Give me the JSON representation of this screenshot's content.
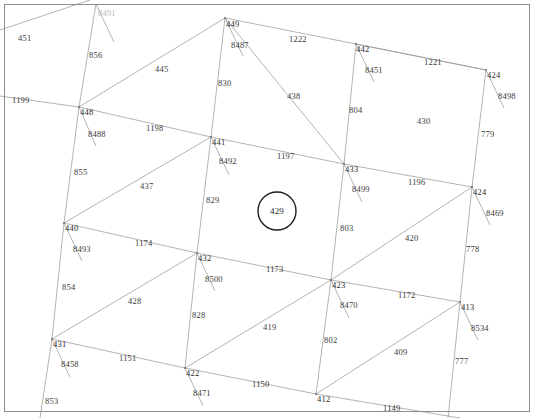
{
  "view": {
    "width": 534,
    "height": 419,
    "background": "#ffffff",
    "border_color": "#8d8d8d",
    "line_color": "#9a9a9a",
    "line_color_strong": "#6f6f6f",
    "label_color": "#3a3a3a",
    "highlight_color": "#1f1f1f"
  },
  "highlight": {
    "shape": "circle",
    "label": "429",
    "cx": 277,
    "cy": 211,
    "r": 19
  },
  "labels": [
    {
      "text": "8491",
      "x": 98,
      "y": 9,
      "kind": "faint"
    },
    {
      "text": "451",
      "x": 18,
      "y": 34,
      "kind": "plain"
    },
    {
      "text": "856",
      "x": 89,
      "y": 51,
      "kind": "plain"
    },
    {
      "text": "449",
      "x": 226,
      "y": 20,
      "kind": "node"
    },
    {
      "text": "8487",
      "x": 231,
      "y": 41,
      "kind": "plain"
    },
    {
      "text": "1222",
      "x": 289,
      "y": 35,
      "kind": "plain"
    },
    {
      "text": "442",
      "x": 356,
      "y": 45,
      "kind": "node"
    },
    {
      "text": "8451",
      "x": 365,
      "y": 66,
      "kind": "plain"
    },
    {
      "text": "1221",
      "x": 424,
      "y": 58,
      "kind": "plain"
    },
    {
      "text": "424",
      "x": 487,
      "y": 71,
      "kind": "node"
    },
    {
      "text": "8498",
      "x": 498,
      "y": 92,
      "kind": "plain"
    },
    {
      "text": "445",
      "x": 155,
      "y": 65,
      "kind": "plain"
    },
    {
      "text": "830",
      "x": 218,
      "y": 79,
      "kind": "plain"
    },
    {
      "text": "438",
      "x": 287,
      "y": 92,
      "kind": "plain"
    },
    {
      "text": "804",
      "x": 349,
      "y": 106,
      "kind": "plain"
    },
    {
      "text": "430",
      "x": 417,
      "y": 117,
      "kind": "plain"
    },
    {
      "text": "1199",
      "x": 12,
      "y": 96,
      "kind": "plain"
    },
    {
      "text": "448",
      "x": 80,
      "y": 108,
      "kind": "node"
    },
    {
      "text": "8488",
      "x": 88,
      "y": 130,
      "kind": "plain"
    },
    {
      "text": "1198",
      "x": 146,
      "y": 124,
      "kind": "plain"
    },
    {
      "text": "441",
      "x": 212,
      "y": 138,
      "kind": "node"
    },
    {
      "text": "8492",
      "x": 219,
      "y": 157,
      "kind": "plain"
    },
    {
      "text": "1197",
      "x": 277,
      "y": 152,
      "kind": "plain"
    },
    {
      "text": "433",
      "x": 345,
      "y": 165,
      "kind": "node"
    },
    {
      "text": "8499",
      "x": 352,
      "y": 185,
      "kind": "plain"
    },
    {
      "text": "779",
      "x": 481,
      "y": 130,
      "kind": "plain"
    },
    {
      "text": "855",
      "x": 74,
      "y": 168,
      "kind": "plain"
    },
    {
      "text": "437",
      "x": 140,
      "y": 182,
      "kind": "plain"
    },
    {
      "text": "829",
      "x": 206,
      "y": 196,
      "kind": "plain"
    },
    {
      "text": "1196",
      "x": 408,
      "y": 178,
      "kind": "plain"
    },
    {
      "text": "424",
      "x": 473,
      "y": 188,
      "kind": "node"
    },
    {
      "text": "8469",
      "x": 486,
      "y": 209,
      "kind": "plain"
    },
    {
      "text": "440",
      "x": 65,
      "y": 224,
      "kind": "node"
    },
    {
      "text": "8493",
      "x": 73,
      "y": 245,
      "kind": "plain"
    },
    {
      "text": "1174",
      "x": 135,
      "y": 239,
      "kind": "plain"
    },
    {
      "text": "432",
      "x": 198,
      "y": 254,
      "kind": "node"
    },
    {
      "text": "8500",
      "x": 205,
      "y": 275,
      "kind": "plain"
    },
    {
      "text": "803",
      "x": 340,
      "y": 224,
      "kind": "plain"
    },
    {
      "text": "420",
      "x": 405,
      "y": 234,
      "kind": "plain"
    },
    {
      "text": "778",
      "x": 466,
      "y": 245,
      "kind": "plain"
    },
    {
      "text": "1173",
      "x": 266,
      "y": 265,
      "kind": "plain"
    },
    {
      "text": "423",
      "x": 332,
      "y": 281,
      "kind": "node"
    },
    {
      "text": "8470",
      "x": 340,
      "y": 301,
      "kind": "plain"
    },
    {
      "text": "1172",
      "x": 398,
      "y": 291,
      "kind": "plain"
    },
    {
      "text": "413",
      "x": 461,
      "y": 303,
      "kind": "node"
    },
    {
      "text": "8534",
      "x": 471,
      "y": 324,
      "kind": "plain"
    },
    {
      "text": "854",
      "x": 62,
      "y": 283,
      "kind": "plain"
    },
    {
      "text": "428",
      "x": 128,
      "y": 297,
      "kind": "plain"
    },
    {
      "text": "828",
      "x": 192,
      "y": 311,
      "kind": "plain"
    },
    {
      "text": "419",
      "x": 263,
      "y": 323,
      "kind": "plain"
    },
    {
      "text": "802",
      "x": 324,
      "y": 336,
      "kind": "plain"
    },
    {
      "text": "409",
      "x": 394,
      "y": 348,
      "kind": "plain"
    },
    {
      "text": "777",
      "x": 455,
      "y": 357,
      "kind": "plain"
    },
    {
      "text": "431",
      "x": 53,
      "y": 340,
      "kind": "node"
    },
    {
      "text": "8458",
      "x": 61,
      "y": 360,
      "kind": "plain"
    },
    {
      "text": "1151",
      "x": 119,
      "y": 354,
      "kind": "plain"
    },
    {
      "text": "422",
      "x": 186,
      "y": 369,
      "kind": "node"
    },
    {
      "text": "8471",
      "x": 193,
      "y": 389,
      "kind": "plain"
    },
    {
      "text": "1150",
      "x": 252,
      "y": 380,
      "kind": "plain"
    },
    {
      "text": "412",
      "x": 317,
      "y": 395,
      "kind": "node"
    },
    {
      "text": "1149",
      "x": 383,
      "y": 404,
      "kind": "plain"
    },
    {
      "text": "853",
      "x": 45,
      "y": 397,
      "kind": "plain"
    }
  ],
  "nodes": [
    {
      "id": "449",
      "x": 225,
      "y": 18
    },
    {
      "id": "442",
      "x": 356,
      "y": 44
    },
    {
      "id": "424t",
      "x": 486,
      "y": 70
    },
    {
      "id": "448",
      "x": 79,
      "y": 107
    },
    {
      "id": "441",
      "x": 211,
      "y": 137
    },
    {
      "id": "433",
      "x": 344,
      "y": 164
    },
    {
      "id": "424m",
      "x": 472,
      "y": 187
    },
    {
      "id": "440",
      "x": 64,
      "y": 223
    },
    {
      "id": "432",
      "x": 197,
      "y": 253
    },
    {
      "id": "423",
      "x": 331,
      "y": 280
    },
    {
      "id": "413",
      "x": 460,
      "y": 302
    },
    {
      "id": "431",
      "x": 52,
      "y": 339
    },
    {
      "id": "422",
      "x": 185,
      "y": 368
    },
    {
      "id": "412",
      "x": 316,
      "y": 394
    }
  ],
  "edges": [
    {
      "name": "445",
      "from": [
        79,
        107
      ],
      "to": [
        225,
        18
      ]
    },
    {
      "name": "1198",
      "from": [
        79,
        107
      ],
      "to": [
        211,
        137
      ]
    },
    {
      "name": "437",
      "from": [
        64,
        223
      ],
      "to": [
        211,
        137
      ]
    },
    {
      "name": "1174",
      "from": [
        64,
        223
      ],
      "to": [
        197,
        253
      ]
    },
    {
      "name": "428",
      "from": [
        52,
        339
      ],
      "to": [
        197,
        253
      ]
    },
    {
      "name": "1151",
      "from": [
        52,
        339
      ],
      "to": [
        185,
        368
      ]
    },
    {
      "name": "1222",
      "from": [
        225,
        18
      ],
      "to": [
        356,
        44
      ]
    },
    {
      "name": "1221",
      "from": [
        356,
        44
      ],
      "to": [
        486,
        70
      ]
    },
    {
      "name": "1197",
      "from": [
        211,
        137
      ],
      "to": [
        344,
        164
      ]
    },
    {
      "name": "1196",
      "from": [
        344,
        164
      ],
      "to": [
        472,
        187
      ]
    },
    {
      "name": "1173",
      "from": [
        197,
        253
      ],
      "to": [
        331,
        280
      ]
    },
    {
      "name": "1172",
      "from": [
        331,
        280
      ],
      "to": [
        460,
        302
      ]
    },
    {
      "name": "1150",
      "from": [
        185,
        368
      ],
      "to": [
        316,
        394
      ]
    },
    {
      "name": "438",
      "from": [
        225,
        18
      ],
      "to": [
        344,
        164
      ]
    },
    {
      "name": "430",
      "from": [
        356,
        44
      ],
      "to": [
        486,
        70
      ]
    },
    {
      "name": "420",
      "from": [
        331,
        280
      ],
      "to": [
        472,
        187
      ]
    },
    {
      "name": "409",
      "from": [
        316,
        394
      ],
      "to": [
        460,
        302
      ]
    },
    {
      "name": "419",
      "from": [
        185,
        368
      ],
      "to": [
        331,
        280
      ]
    },
    {
      "name": "830",
      "from": [
        225,
        18
      ],
      "to": [
        211,
        137
      ]
    },
    {
      "name": "829",
      "from": [
        211,
        137
      ],
      "to": [
        197,
        253
      ]
    },
    {
      "name": "828",
      "from": [
        197,
        253
      ],
      "to": [
        185,
        368
      ]
    },
    {
      "name": "804",
      "from": [
        356,
        44
      ],
      "to": [
        344,
        164
      ]
    },
    {
      "name": "803",
      "from": [
        344,
        164
      ],
      "to": [
        331,
        280
      ]
    },
    {
      "name": "802",
      "from": [
        331,
        280
      ],
      "to": [
        316,
        394
      ]
    },
    {
      "name": "856",
      "from": [
        79,
        107
      ],
      "to": [
        96,
        4
      ]
    },
    {
      "name": "855",
      "from": [
        79,
        107
      ],
      "to": [
        64,
        223
      ]
    },
    {
      "name": "854",
      "from": [
        64,
        223
      ],
      "to": [
        52,
        339
      ]
    },
    {
      "name": "853",
      "from": [
        52,
        339
      ],
      "to": [
        40,
        418
      ]
    },
    {
      "name": "779",
      "from": [
        486,
        70
      ],
      "to": [
        472,
        187
      ]
    },
    {
      "name": "778",
      "from": [
        472,
        187
      ],
      "to": [
        460,
        302
      ]
    },
    {
      "name": "777",
      "from": [
        460,
        302
      ],
      "to": [
        448,
        418
      ]
    },
    {
      "name": "1199",
      "from": [
        0,
        96
      ],
      "to": [
        79,
        107
      ]
    },
    {
      "name": "451",
      "from": [
        0,
        30
      ],
      "to": [
        90,
        0
      ]
    },
    {
      "name": "1149",
      "from": [
        316,
        394
      ],
      "to": [
        460,
        418
      ]
    },
    {
      "name": "8487",
      "from": [
        225,
        18
      ],
      "to": [
        243,
        56
      ]
    },
    {
      "name": "8488",
      "from": [
        79,
        107
      ],
      "to": [
        96,
        146
      ]
    },
    {
      "name": "8492",
      "from": [
        211,
        137
      ],
      "to": [
        229,
        175
      ]
    },
    {
      "name": "8493",
      "from": [
        64,
        223
      ],
      "to": [
        82,
        261
      ]
    },
    {
      "name": "8500",
      "from": [
        197,
        253
      ],
      "to": [
        215,
        291
      ]
    },
    {
      "name": "8458",
      "from": [
        52,
        339
      ],
      "to": [
        70,
        377
      ]
    },
    {
      "name": "8471",
      "from": [
        185,
        368
      ],
      "to": [
        203,
        406
      ]
    },
    {
      "name": "8451",
      "from": [
        356,
        44
      ],
      "to": [
        374,
        82
      ]
    },
    {
      "name": "8499",
      "from": [
        344,
        164
      ],
      "to": [
        362,
        202
      ]
    },
    {
      "name": "8470",
      "from": [
        331,
        280
      ],
      "to": [
        349,
        318
      ]
    },
    {
      "name": "8498",
      "from": [
        486,
        70
      ],
      "to": [
        504,
        108
      ]
    },
    {
      "name": "8469",
      "from": [
        472,
        187
      ],
      "to": [
        490,
        225
      ]
    },
    {
      "name": "8534",
      "from": [
        460,
        302
      ],
      "to": [
        478,
        340
      ]
    },
    {
      "name": "8491",
      "from": [
        96,
        4
      ],
      "to": [
        114,
        42
      ]
    }
  ]
}
